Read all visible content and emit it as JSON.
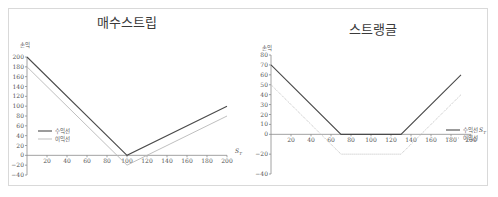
{
  "chart_data": [
    {
      "type": "line",
      "title": "매수스트립",
      "xlabel": "S_T",
      "ylabel": "손익",
      "xlim": [
        0,
        200
      ],
      "ylim": [
        -40,
        200
      ],
      "x_ticks": [
        20,
        40,
        60,
        80,
        100,
        120,
        140,
        160,
        180,
        200
      ],
      "y_ticks": [
        -40,
        -20,
        0,
        20,
        40,
        60,
        80,
        100,
        120,
        140,
        160,
        180,
        200
      ],
      "grid": false,
      "legend_position": "left-middle",
      "series": [
        {
          "name": "수익선",
          "style": "solid",
          "color": "#4a4a4a",
          "points": [
            [
              0,
              200
            ],
            [
              100,
              0
            ],
            [
              200,
              100
            ]
          ]
        },
        {
          "name": "이익선",
          "style": "solid",
          "color": "#b8b8b8",
          "points": [
            [
              0,
              180
            ],
            [
              100,
              -20
            ],
            [
              200,
              80
            ]
          ]
        }
      ]
    },
    {
      "type": "line",
      "title": "스트랭글",
      "xlabel": "S_T",
      "ylabel": "손익",
      "xlim": [
        0,
        200
      ],
      "ylim": [
        -40,
        80
      ],
      "x_ticks": [
        20,
        40,
        60,
        80,
        100,
        120,
        140,
        160,
        180,
        200
      ],
      "y_ticks": [
        -40,
        -20,
        0,
        10,
        20,
        30,
        40,
        50,
        60,
        70,
        80
      ],
      "grid": false,
      "legend_position": "right-middle",
      "series": [
        {
          "name": "수익선",
          "style": "solid",
          "color": "#4a4a4a",
          "points": [
            [
              0,
              70
            ],
            [
              70,
              0
            ],
            [
              130,
              0
            ],
            [
              190,
              60
            ]
          ]
        },
        {
          "name": "이익선",
          "style": "dotted",
          "color": "#b8b8b8",
          "points": [
            [
              0,
              50
            ],
            [
              70,
              -20
            ],
            [
              130,
              -20
            ],
            [
              190,
              40
            ]
          ]
        }
      ]
    }
  ]
}
